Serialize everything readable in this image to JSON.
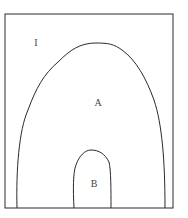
{
  "diagram": {
    "type": "nested-region-diagram",
    "regions": [
      {
        "id": "outer",
        "label": "I",
        "shape": "rectangle"
      },
      {
        "id": "region-a",
        "label": "A",
        "shape": "arch",
        "contained_in": "outer"
      },
      {
        "id": "region-b",
        "label": "B",
        "shape": "arch",
        "contained_in": "region-a"
      }
    ],
    "labels": {
      "outer": "I",
      "region_a": "A",
      "region_b": "B"
    },
    "colors": {
      "stroke": "#2a2a2a",
      "background": "#ffffff",
      "text": "#444444"
    }
  }
}
